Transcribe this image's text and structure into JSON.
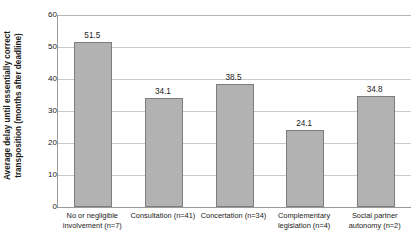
{
  "chart_data": {
    "type": "bar",
    "title": "",
    "xlabel": "",
    "ylabel_line1": "Average delay until essentially correct",
    "ylabel_line2": "transposition (months after deadline)",
    "ylim": [
      0,
      60
    ],
    "yticks": [
      0,
      10,
      20,
      30,
      40,
      50,
      60
    ],
    "ytick_labels": [
      "0",
      "10",
      "20",
      "30",
      "40",
      "50",
      "60"
    ],
    "grid": true,
    "legend": "none",
    "categories": [
      "No or negligible involvement (n=7)",
      "Consultation (n=41)",
      "Concertation (n=34)",
      "Complementary legislation (n=4)",
      "Social partner autonomy (n=2)"
    ],
    "category_lines": [
      [
        "No or negligible",
        "involvement (n=7)"
      ],
      [
        "Consultation (n=41)",
        ""
      ],
      [
        "Concertation (n=34)",
        ""
      ],
      [
        "Complementary",
        "legislation (n=4)"
      ],
      [
        "Social partner",
        "autonomy (n=2)"
      ]
    ],
    "values": [
      51.5,
      34.1,
      38.5,
      24.1,
      34.8
    ],
    "value_labels": [
      "51.5",
      "34.1",
      "38.5",
      "24.1",
      "34.8"
    ],
    "colors": {
      "bar_fill": "#b2b2b2",
      "bar_border": "#7d7d7d",
      "gridline": "#c9c9c9",
      "axis": "#9a9a9a",
      "text": "#1a1a1a",
      "background": "#ffffff"
    }
  }
}
